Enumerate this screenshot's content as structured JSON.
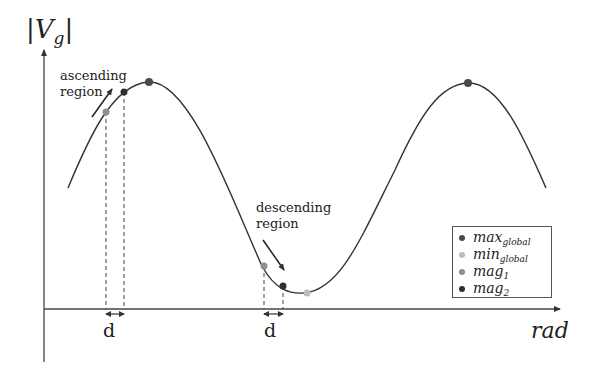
{
  "diagram": {
    "y_axis_label": "|V",
    "y_axis_label_sub": "g",
    "y_axis_label_close": "|",
    "x_axis_label": "rad",
    "annotations": {
      "ascending_line1": "ascending",
      "ascending_line2": "region",
      "descending_line1": "descending",
      "descending_line2": "region",
      "spacing_label_1": "d",
      "spacing_label_2": "d"
    },
    "legend": [
      {
        "base": "max",
        "sub": "global",
        "color": "#4a4a4a"
      },
      {
        "base": "min",
        "sub": "global",
        "color": "#bdbdbd"
      },
      {
        "base": "mag",
        "sub": "1",
        "color": "#8e8e8e"
      },
      {
        "base": "mag",
        "sub": "2",
        "color": "#2e2e2e"
      }
    ],
    "colors": {
      "curve": "#333333",
      "axis": "#444444",
      "max_global": "#4a4a4a",
      "min_global": "#bdbdbd",
      "mag1": "#8e8e8e",
      "mag2": "#2e2e2e"
    }
  }
}
